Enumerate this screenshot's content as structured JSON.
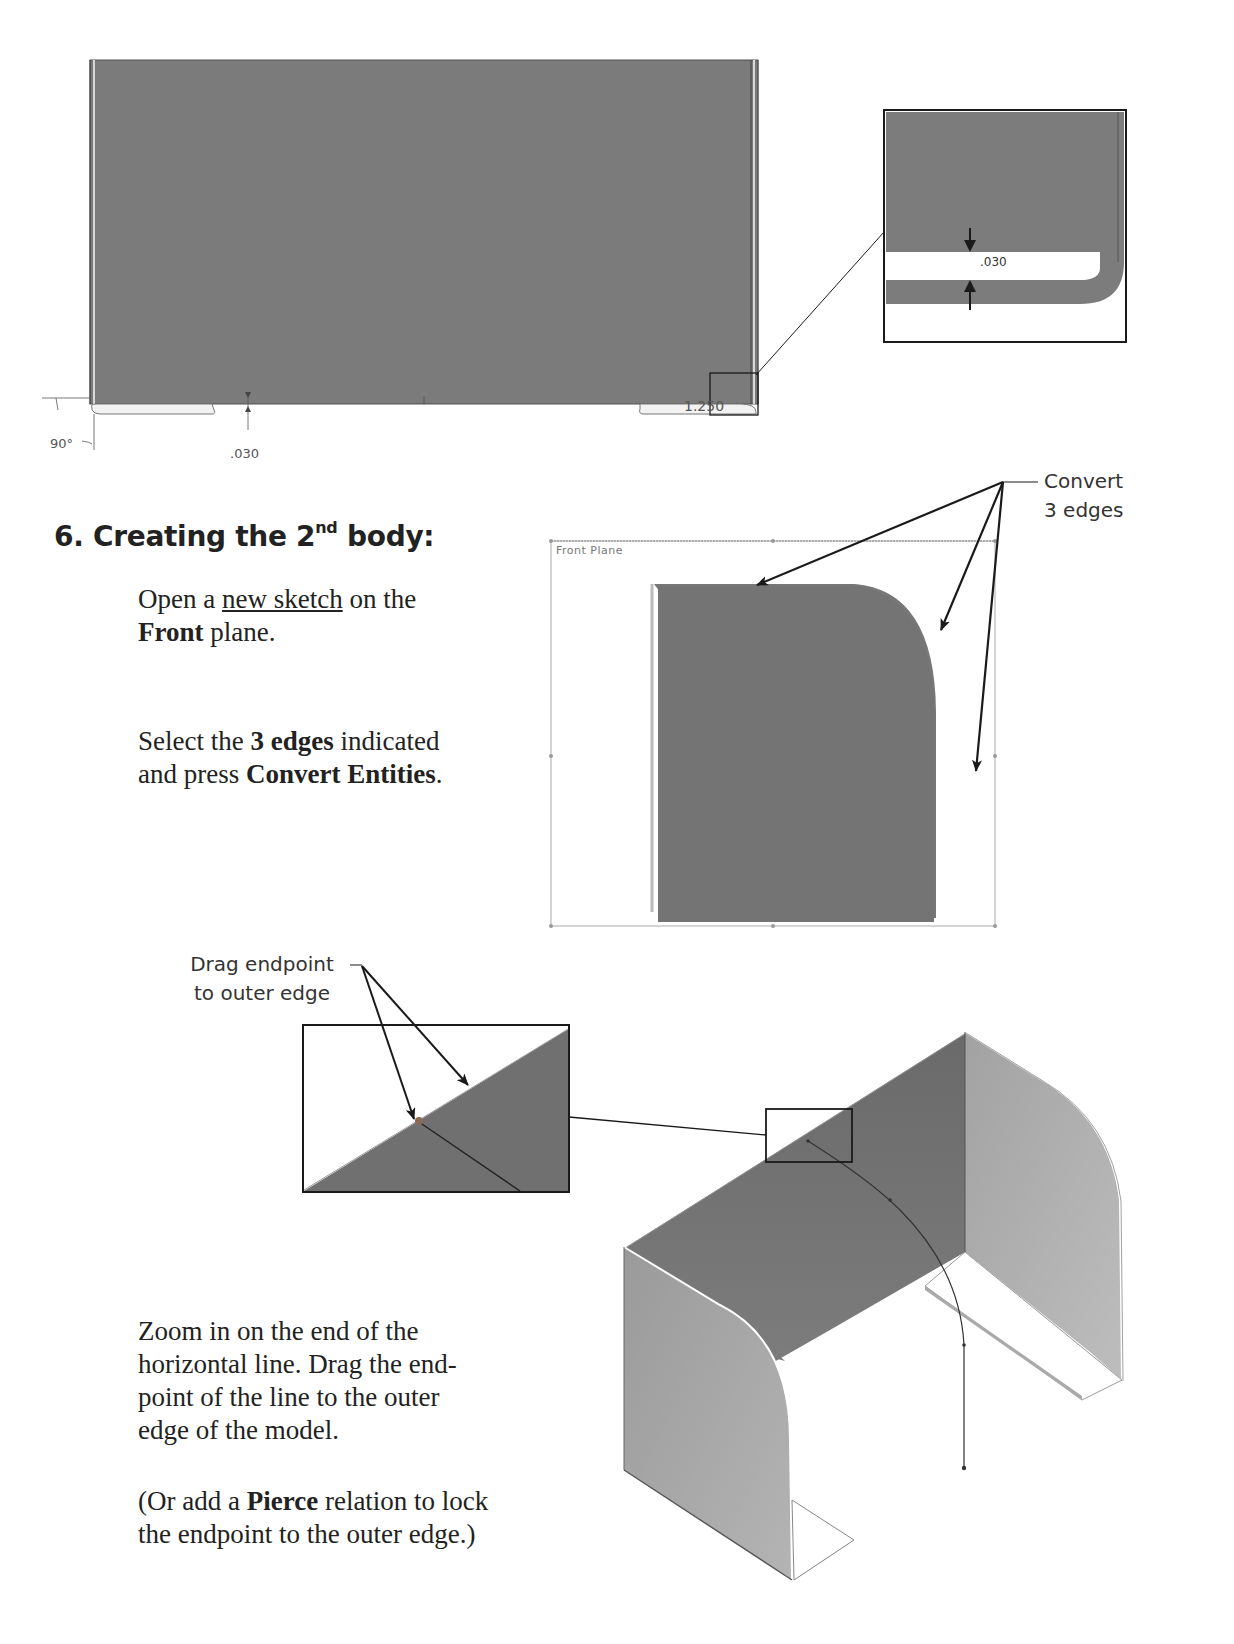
{
  "top_figure": {
    "dimensions": {
      "angle": "90°",
      "thickness_bottom": ".030",
      "radius": "1.250",
      "thickness_detail": ".030"
    }
  },
  "section": {
    "number": "6.",
    "title_prefix": "Creating the 2",
    "title_sup": "nd",
    "title_suffix": " body:"
  },
  "steps": {
    "step1": {
      "t1": "Open a ",
      "link": "new sketch",
      "t2": " on the",
      "b1": "Front",
      "t3": " plane."
    },
    "step2": {
      "t1": "Select the ",
      "b1": "3 edges",
      "t2": " indicated",
      "t3": "and press ",
      "b2": "Convert Entities",
      "t4": "."
    },
    "step3": {
      "line1": "Zoom in on the end of the",
      "line2": "horizontal line. Drag the end-",
      "line3": "point of the line to the outer",
      "line4": "edge of the model."
    },
    "step4": {
      "t1": "(Or add a ",
      "b1": "Pierce",
      "t2": " relation to lock",
      "line2": "the endpoint to the outer edge.)"
    }
  },
  "callouts": {
    "convert_line1": "Convert",
    "convert_line2": "3 edges",
    "drag_line1": "Drag endpoint",
    "drag_line2": "to outer edge"
  },
  "sketch_figure": {
    "plane_label": "Front Plane"
  },
  "colors": {
    "face_dark": "#6e6e6e",
    "face_mid": "#7a7a7a",
    "face_light": "#a9a9a9",
    "line": "#1a1a1a"
  }
}
